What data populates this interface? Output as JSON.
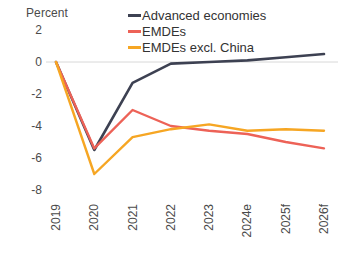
{
  "chart_data": {
    "type": "line",
    "title": "",
    "subtitle": "",
    "xlabel": "",
    "ylabel": "Percent",
    "unit_label": "Percent",
    "categories": [
      "2019",
      "2020",
      "2021",
      "2022",
      "2023",
      "2024e",
      "2025f",
      "2026f"
    ],
    "ylim": [
      -8,
      2
    ],
    "yticks": [
      2,
      0,
      -2,
      -4,
      -6,
      -8
    ],
    "ytick_labels": [
      "2",
      "0",
      "-2",
      "-4",
      "-6",
      "-8"
    ],
    "grid": false,
    "zero_line": true,
    "legend_position": "top-right",
    "series": [
      {
        "name": "Advanced economies",
        "color": "#3d4152",
        "values": [
          0.0,
          -5.5,
          -1.3,
          -0.1,
          0.0,
          0.1,
          0.3,
          0.5
        ]
      },
      {
        "name": "EMDEs",
        "color": "#ed6257",
        "values": [
          0.0,
          -5.4,
          -3.0,
          -4.0,
          -4.3,
          -4.5,
          -5.0,
          -5.4
        ]
      },
      {
        "name": "EMDEs excl. China",
        "color": "#f6a623",
        "values": [
          0.0,
          -7.0,
          -4.7,
          -4.2,
          -3.9,
          -4.3,
          -4.2,
          -4.3
        ]
      }
    ]
  },
  "legend": {
    "items": [
      {
        "label": "Advanced economies",
        "color": "#3d4152"
      },
      {
        "label": "EMDEs",
        "color": "#ed6257"
      },
      {
        "label": "EMDEs excl. China",
        "color": "#f6a623"
      }
    ]
  },
  "axes": {
    "y_unit": "Percent",
    "y_ticks": [
      "2",
      "0",
      "-2",
      "-4",
      "-6",
      "-8"
    ],
    "x_ticks": [
      "2019",
      "2020",
      "2021",
      "2022",
      "2023",
      "2024e",
      "2025f",
      "2026f"
    ]
  },
  "colors": {
    "advanced_economies": "#3d4152",
    "emdes": "#ed6257",
    "emdes_excl_china": "#f6a623",
    "axis_text": "#4b4b4b",
    "zero_line": "#d8d8d8",
    "background": "#ffffff"
  }
}
